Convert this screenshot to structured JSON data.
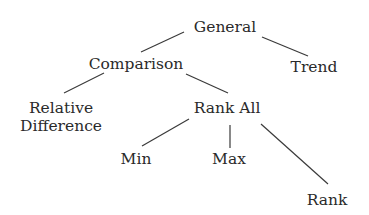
{
  "diagram": {
    "type": "tree",
    "nodes": {
      "general": "General",
      "comparison": "Comparison",
      "trend": "Trend",
      "relative_difference_line1": "Relative",
      "relative_difference_line2": "Difference",
      "rank_all": "Rank All",
      "min": "Min",
      "max": "Max",
      "rank": "Rank"
    },
    "edges": [
      {
        "from": "General",
        "to": "Comparison"
      },
      {
        "from": "General",
        "to": "Trend"
      },
      {
        "from": "Comparison",
        "to": "Relative Difference"
      },
      {
        "from": "Comparison",
        "to": "Rank All"
      },
      {
        "from": "Rank All",
        "to": "Min"
      },
      {
        "from": "Rank All",
        "to": "Max"
      },
      {
        "from": "Rank All",
        "to": "Rank"
      }
    ]
  }
}
